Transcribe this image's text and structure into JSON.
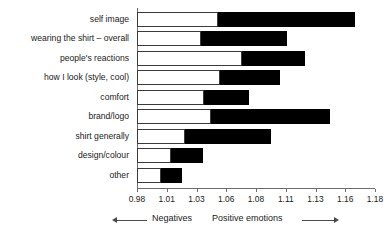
{
  "chart_data": {
    "type": "bar",
    "title": "",
    "subtitle": "",
    "xlabel": "",
    "ylabel": "",
    "orientation": "horizontal",
    "stacked": true,
    "grid": false,
    "legend_position": "below-axis",
    "baseline": 0.98,
    "xlim": [
      0.98,
      1.18
    ],
    "xticks": [
      0.98,
      1.01,
      1.03,
      1.06,
      1.08,
      1.11,
      1.13,
      1.16,
      1.18
    ],
    "xticklabels": [
      "0.98",
      "1.01",
      "1.03",
      "1.06",
      "1.08",
      "1.11",
      "1.13",
      "1.16",
      "1.18"
    ],
    "categories": [
      "self image",
      "wearing the shirt – overall",
      "people's reactions",
      "how I look (style, cool)",
      "comfort",
      "brand/logo",
      "shirt generally",
      "design/colour",
      "other"
    ],
    "series": [
      {
        "name": "Negatives",
        "color": "#ffffff",
        "description": "white (unfilled) segment measured from the 0.98 baseline",
        "segment_end": [
          1.048,
          1.034,
          1.068,
          1.05,
          1.036,
          1.042,
          1.02,
          1.0085,
          1.0
        ]
      },
      {
        "name": "Positive emotions",
        "color": "#000000",
        "description": "black (filled) segment continuing to the bar end",
        "segment_end": [
          1.163,
          1.106,
          1.121,
          1.1,
          1.074,
          1.142,
          1.093,
          1.0355,
          1.018
        ]
      }
    ],
    "axis_legend": {
      "negative_label": "Negatives",
      "positive_label": "Positive emotions",
      "negative_arrow": "left-arrow-icon",
      "positive_arrow": "right-arrow-icon"
    }
  }
}
